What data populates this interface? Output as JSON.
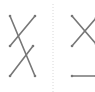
{
  "diagram": {
    "stroke_color": "#777777",
    "divider_color": "#d8d8d8",
    "left_panel": {
      "lines": [
        {
          "x1": 10,
          "y1": 16,
          "x2": 35,
          "y2": 76
        },
        {
          "x1": 10,
          "y1": 46,
          "x2": 35,
          "y2": 16
        },
        {
          "x1": 10,
          "y1": 76,
          "x2": 33,
          "y2": 46
        }
      ]
    },
    "right_panel": {
      "lines": [
        {
          "x1": 72,
          "y1": 16,
          "x2": 96,
          "y2": 44
        },
        {
          "x1": 72,
          "y1": 46,
          "x2": 96,
          "y2": 18
        },
        {
          "x1": 72,
          "y1": 76,
          "x2": 96,
          "y2": 76
        }
      ]
    },
    "divider": {
      "x": 53,
      "y1": 4,
      "y2": 92
    }
  }
}
